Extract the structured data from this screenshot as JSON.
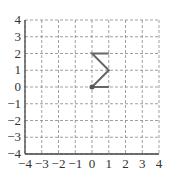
{
  "chart_data": {
    "type": "line",
    "title": "",
    "xlabel": "",
    "ylabel": "",
    "xlim": [
      -4,
      4
    ],
    "ylim": [
      -4,
      4
    ],
    "grid": true,
    "grid_style": "dashed",
    "x_ticks": [
      "−4",
      "−3",
      "−2",
      "−1",
      "0",
      "1",
      "2",
      "3",
      "4"
    ],
    "y_ticks": [
      "−4",
      "−3",
      "−2",
      "−1",
      "0",
      "1",
      "2",
      "3",
      "4"
    ],
    "series": [
      {
        "name": "path",
        "points": [
          [
            1,
            2
          ],
          [
            0,
            2
          ],
          [
            1,
            1
          ],
          [
            0,
            0
          ],
          [
            1,
            0
          ]
        ],
        "color": "#666666"
      }
    ],
    "markers": [
      {
        "x": 0,
        "y": 0,
        "color": "#555555"
      }
    ]
  }
}
